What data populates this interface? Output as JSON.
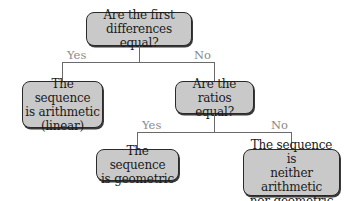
{
  "diagram": {
    "type": "decision-flowchart",
    "nodes": {
      "q1": {
        "text": "Are the first\ndifferences equal?",
        "kind": "decision"
      },
      "arithmetic": {
        "text": "The sequence\nis arithmetic\n(linear)",
        "kind": "outcome"
      },
      "q2": {
        "text": "Are the\nratios equal?",
        "kind": "decision"
      },
      "geometric": {
        "text": "The sequence\nis geometric",
        "kind": "outcome"
      },
      "neither": {
        "text": "The sequence is\nneither arithmetic\nnor geometric",
        "kind": "outcome"
      }
    },
    "edges": {
      "q1_yes": {
        "from": "q1",
        "to": "arithmetic",
        "label": "Yes"
      },
      "q1_no": {
        "from": "q1",
        "to": "q2",
        "label": "No"
      },
      "q2_yes": {
        "from": "q2",
        "to": "geometric",
        "label": "Yes"
      },
      "q2_no": {
        "from": "q2",
        "to": "neither",
        "label": "No"
      }
    },
    "colors": {
      "node_fill": "#c9c9c9",
      "node_border": "#2a2a2a",
      "connector": "#6a6a6a",
      "edge_label": "#8a8a8a",
      "text": "#1a1a1a"
    }
  }
}
